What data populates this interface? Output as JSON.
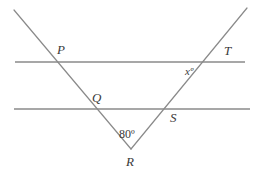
{
  "figure": {
    "kind": "geometry-diagram",
    "background_color": "#ffffff",
    "line_color": "#8a8a8a",
    "label_color": "#3a3a3a",
    "line_width": 1.2
  },
  "labels": {
    "p": "P",
    "q": "Q",
    "r": "R",
    "s": "S",
    "t": "T",
    "angle_at_r": "80º",
    "angle_x": "xº"
  },
  "geometry": {
    "points": {
      "left_ray_top": {
        "x": 14,
        "y": 10
      },
      "P": {
        "x": 56,
        "y": 62
      },
      "Q": {
        "x": 91,
        "y": 109
      },
      "R": {
        "x": 131,
        "y": 149
      },
      "S": {
        "x": 167,
        "y": 112
      },
      "T": {
        "x": 212,
        "y": 62
      },
      "right_ray_top": {
        "x": 247,
        "y": 8
      }
    },
    "upper_parallel_line": {
      "y": 62,
      "x_start": 15,
      "x_end": 245
    },
    "lower_parallel_line": {
      "y": 109,
      "x_start": 14,
      "x_end": 250
    }
  },
  "values": {
    "angle_r_degrees": 80,
    "angle_x_unknown": "x"
  }
}
